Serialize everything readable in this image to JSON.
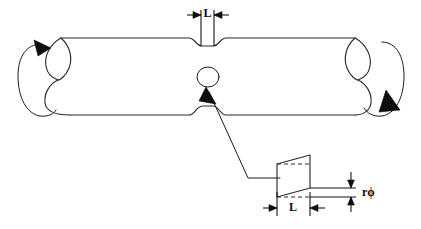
{
  "figure": {
    "title": "Torsion of a circular shaft with a narrowed (necked) midsection"
  },
  "labels": {
    "length_top": "L",
    "length_detail": "L",
    "shear_offset": "rϕ"
  },
  "icons": {
    "torque_left": "rotation-arrow-icon",
    "torque_right": "rotation-arrow-icon",
    "callout_pointer": "arrowhead-icon",
    "element_marker": "circle-marker-icon"
  },
  "colors": {
    "background": "#ffffff",
    "line": "#2b2b2b",
    "dimension": "#151515",
    "arrowhead": "#0d0d0d"
  },
  "annotations": {
    "top_dimension": "Axial width L of the reduced-diameter groove, measured between two extension lines above the shaft.",
    "detail_vertical_dimension": "rϕ — tangential displacement of the surface element, equal to radius r times twist angle phi.",
    "detail_horizontal_dimension": "L — base width of the sheared element, matching the groove width."
  }
}
